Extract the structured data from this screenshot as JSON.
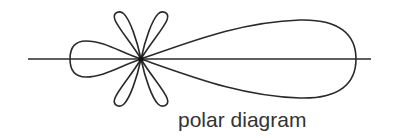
{
  "diagram": {
    "caption": "polar diagram",
    "stroke_color": "#2a2a2a",
    "caption_color": "#333333",
    "center": [
      141,
      59
    ],
    "axis": {
      "x_start": 28,
      "x_end": 371,
      "y": 59
    },
    "lobes": [
      {
        "name": "main-lobe",
        "direction_deg": 0,
        "tip_x": 356,
        "half_width": 39
      },
      {
        "name": "back-lobe",
        "direction_deg": 180,
        "tip_x": 70,
        "half_width": 18
      },
      {
        "name": "side-lobe-upper-left",
        "direction_deg": 115
      },
      {
        "name": "side-lobe-upper-right",
        "direction_deg": 65
      },
      {
        "name": "side-lobe-lower-left",
        "direction_deg": 245
      },
      {
        "name": "side-lobe-lower-right",
        "direction_deg": 295
      }
    ]
  }
}
